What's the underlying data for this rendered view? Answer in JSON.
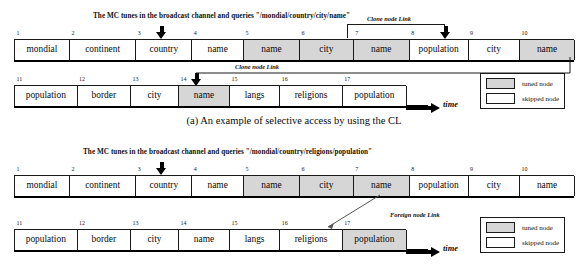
{
  "figure_a": {
    "query_title": "The MC tunes in the broadcast channel and queries \"/mondial/country/city/name\"",
    "row1": {
      "cells": [
        {
          "idx": "1",
          "label": "mondial",
          "state": "skipped"
        },
        {
          "idx": "2",
          "label": "continent",
          "state": "skipped"
        },
        {
          "idx": "3",
          "label": "country",
          "state": "skipped"
        },
        {
          "idx": "4",
          "label": "name",
          "state": "skipped"
        },
        {
          "idx": "5",
          "label": "name",
          "state": "tuned"
        },
        {
          "idx": "6",
          "label": "city",
          "state": "tuned"
        },
        {
          "idx": "7",
          "label": "name",
          "state": "tuned"
        },
        {
          "idx": "8",
          "label": "population",
          "state": "skipped"
        },
        {
          "idx": "9",
          "label": "city",
          "state": "skipped"
        },
        {
          "idx": "10",
          "label": "name",
          "state": "tuned"
        }
      ]
    },
    "row2": {
      "cells": [
        {
          "idx": "11",
          "label": "population",
          "state": "skipped"
        },
        {
          "idx": "12",
          "label": "border",
          "state": "skipped"
        },
        {
          "idx": "13",
          "label": "city",
          "state": "skipped"
        },
        {
          "idx": "14",
          "label": "name",
          "state": "tuned"
        },
        {
          "idx": "15",
          "label": "langs",
          "state": "skipped"
        },
        {
          "idx": "16",
          "label": "religions",
          "state": "skipped"
        },
        {
          "idx": "17",
          "label": "population",
          "state": "skipped"
        }
      ]
    },
    "link_label_1": "Clone node Link",
    "link_label_2": "Clone node Link",
    "time_label": "time",
    "legend": {
      "tuned": "tuned node",
      "skipped": "skipped node"
    }
  },
  "caption_a": "(a) An example of selective access by using the CL",
  "figure_b": {
    "query_title": "The MC tunes in the broadcast channel and queries \"/mondial/country/religions/population\"",
    "row1": {
      "cells": [
        {
          "idx": "1",
          "label": "mondial",
          "state": "skipped"
        },
        {
          "idx": "2",
          "label": "continent",
          "state": "skipped"
        },
        {
          "idx": "3",
          "label": "country",
          "state": "skipped"
        },
        {
          "idx": "4",
          "label": "name",
          "state": "skipped"
        },
        {
          "idx": "5",
          "label": "name",
          "state": "tuned"
        },
        {
          "idx": "6",
          "label": "city",
          "state": "tuned"
        },
        {
          "idx": "7",
          "label": "name",
          "state": "tuned"
        },
        {
          "idx": "8",
          "label": "population",
          "state": "skipped"
        },
        {
          "idx": "9",
          "label": "city",
          "state": "skipped"
        },
        {
          "idx": "10",
          "label": "name",
          "state": "skipped"
        }
      ]
    },
    "row2": {
      "cells": [
        {
          "idx": "11",
          "label": "population",
          "state": "skipped"
        },
        {
          "idx": "12",
          "label": "border",
          "state": "skipped"
        },
        {
          "idx": "13",
          "label": "city",
          "state": "skipped"
        },
        {
          "idx": "14",
          "label": "name",
          "state": "skipped"
        },
        {
          "idx": "15",
          "label": "langs",
          "state": "skipped"
        },
        {
          "idx": "16",
          "label": "religions",
          "state": "skipped"
        },
        {
          "idx": "17",
          "label": "population",
          "state": "tuned"
        }
      ]
    },
    "link_label_1": "Foreign node Link",
    "time_label": "time",
    "legend": {
      "tuned": "tuned node",
      "skipped": "skipped node"
    }
  },
  "colors": {
    "tuned_fill": "#d6d6d6",
    "skipped_fill": "#ffffff",
    "stroke": "#1a1a1a"
  }
}
